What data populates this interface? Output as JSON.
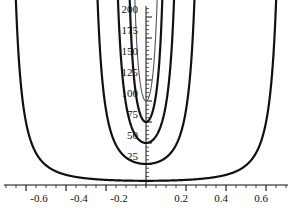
{
  "chart_data": {
    "type": "line",
    "title": "",
    "subtitle": "",
    "xlabel": "",
    "ylabel": "",
    "xlim": [
      -0.78,
      0.78
    ],
    "ylim": [
      0,
      215
    ],
    "grid": false,
    "legend": false,
    "axes": {
      "x_axis_position": "y=0",
      "y_axis_position": "x=0",
      "x_major_ticks": [
        -0.6,
        -0.4,
        -0.2,
        0.2,
        0.4,
        0.6
      ],
      "x_major_tick_labels": [
        "-0.6",
        "-0.4",
        "-0.2",
        "0.2",
        "0.4",
        "0.6"
      ],
      "x_minor_tick_step": 0.05,
      "y_major_ticks": [
        25,
        50,
        75,
        100,
        125,
        150,
        175,
        200
      ],
      "y_major_tick_labels": [
        "25",
        "50",
        "75",
        "100",
        "125",
        "150",
        "175",
        "200"
      ],
      "y_minor_tick_step": 5
    },
    "series": [
      {
        "name": "curve-1",
        "style": "thick-dark",
        "color": "#111111",
        "width": 2.2,
        "asymptote_left": -0.72,
        "asymptote_right": 0.72,
        "minimum_x": 0,
        "minimum_y": 5
      },
      {
        "name": "curve-2",
        "style": "thick-dark",
        "color": "#111111",
        "width": 2.2,
        "asymptote_left": -0.31,
        "asymptote_right": 0.31,
        "minimum_x": 0,
        "minimum_y": 25
      },
      {
        "name": "curve-3",
        "style": "thick-dark",
        "color": "#111111",
        "width": 2.2,
        "asymptote_left": -0.205,
        "asymptote_right": 0.205,
        "minimum_x": 0,
        "minimum_y": 50
      },
      {
        "name": "curve-4",
        "style": "thick-dark",
        "color": "#111111",
        "width": 2.2,
        "asymptote_left": -0.135,
        "asymptote_right": 0.135,
        "minimum_x": 0,
        "minimum_y": 75
      },
      {
        "name": "curve-5",
        "style": "thin-gray",
        "color": "#555555",
        "width": 1.1,
        "asymptote_left": -0.105,
        "asymptote_right": 0.105,
        "minimum_x": 0,
        "minimum_y": 100
      }
    ]
  },
  "y_tick_labels": [
    "200",
    "175",
    "150",
    "125",
    "100",
    "75",
    "50",
    "25"
  ],
  "x_tick_labels": [
    "-0.6",
    "-0.4",
    "-0.2",
    "0.2",
    "0.4",
    "0.6"
  ]
}
